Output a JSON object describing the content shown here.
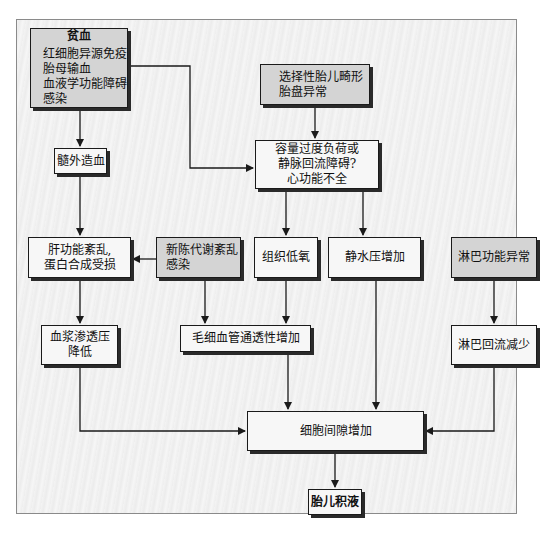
{
  "diagram": {
    "type": "flowchart",
    "nodes": {
      "anemia": {
        "title": "贫血",
        "lines": [
          "红细胞异源免疫",
          "胎母输血",
          "血液学功能障碍",
          "感染"
        ]
      },
      "malformation": {
        "lines": [
          "选择性胎儿畸形",
          "胎盘异常"
        ]
      },
      "extramedullary": {
        "label": "髓外造血"
      },
      "volume_overload": {
        "lines": [
          "容量过度负荷或",
          "静脉回流障碍?",
          "心功能不全"
        ]
      },
      "liver_dysfunction": {
        "lines": [
          "肝功能紊乱,",
          "蛋白合成受损"
        ]
      },
      "metabolic": {
        "lines": [
          "新陈代谢紊乱",
          "感染"
        ]
      },
      "hypoxia": {
        "label": "组织低氧"
      },
      "hydrostatic": {
        "label": "静水压增加"
      },
      "lymph_abnormal": {
        "label": "淋巴功能异常"
      },
      "oncotic": {
        "lines": [
          "血浆渗透压",
          "降低"
        ]
      },
      "capillary": {
        "label": "毛细血管通透性增加"
      },
      "lymph_reduced": {
        "label": "淋巴回流减少"
      },
      "interstitial": {
        "label": "细胞间隙增加"
      },
      "hydrops": {
        "label": "胎儿积液"
      }
    },
    "edges": [
      [
        "贫血",
        "髓外造血"
      ],
      [
        "贫血",
        "容量过度负荷或静脉回流障碍?心功能不全"
      ],
      [
        "选择性胎儿畸形 胎盘异常",
        "容量过度负荷或静脉回流障碍?心功能不全"
      ],
      [
        "髓外造血",
        "肝功能紊乱,蛋白合成受损"
      ],
      [
        "新陈代谢紊乱 感染",
        "肝功能紊乱,蛋白合成受损"
      ],
      [
        "新陈代谢紊乱 感染",
        "毛细血管通透性增加"
      ],
      [
        "容量过度负荷或静脉回流障碍?心功能不全",
        "组织低氧"
      ],
      [
        "容量过度负荷或静脉回流障碍?心功能不全",
        "静水压增加"
      ],
      [
        "组织低氧",
        "毛细血管通透性增加"
      ],
      [
        "肝功能紊乱,蛋白合成受损",
        "血浆渗透压降低"
      ],
      [
        "淋巴功能异常",
        "淋巴回流减少"
      ],
      [
        "血浆渗透压降低",
        "细胞间隙增加"
      ],
      [
        "毛细血管通透性增加",
        "细胞间隙增加"
      ],
      [
        "静水压增加",
        "细胞间隙增加"
      ],
      [
        "淋巴回流减少",
        "细胞间隙增加"
      ],
      [
        "细胞间隙增加",
        "胎儿积液"
      ]
    ],
    "colors": {
      "gray_fill": "#d4d4d4",
      "white_fill": "#f7f7f7",
      "line": "#1a1a1a"
    }
  }
}
